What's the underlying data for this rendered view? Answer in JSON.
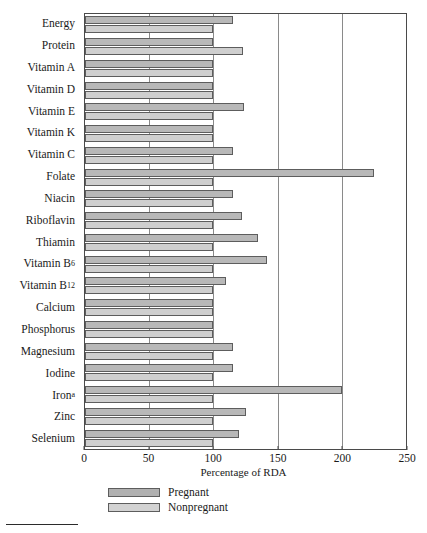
{
  "chart_data": {
    "type": "bar",
    "orientation": "horizontal",
    "title": "",
    "xlabel": "Percentage of RDA",
    "ylabel": "",
    "xlim": [
      0,
      250
    ],
    "xticks": [
      0,
      50,
      100,
      150,
      200,
      250
    ],
    "xtick_labels": [
      "0",
      "50",
      "100",
      "150",
      "200",
      "250"
    ],
    "grid": true,
    "grid_axis": "x",
    "legend_position": "bottom-left",
    "categories": [
      "Energy",
      "Protein",
      "Vitamin A",
      "Vitamin D",
      "Vitamin E",
      "Vitamin K",
      "Vitamin C",
      "Folate",
      "Niacin",
      "Riboflavin",
      "Thiamin",
      "Vitamin B6",
      "Vitamin B12",
      "Calcium",
      "Phosphorus",
      "Magnesium",
      "Iodine",
      "Iron",
      "Zinc",
      "Selenium"
    ],
    "category_labels_html": [
      "Energy",
      "Protein",
      "Vitamin A",
      "Vitamin D",
      "Vitamin E",
      "Vitamin K",
      "Vitamin C",
      "Folate",
      "Niacin",
      "Riboflavin",
      "Thiamin",
      "Vitamin B<sub>6</sub>",
      "Vitamin B<sub>12</sub>",
      "Calcium",
      "Phosphorus",
      "Magnesium",
      "Iodine",
      "Iron<sup>a</sup>",
      "Zinc",
      "Selenium"
    ],
    "series": [
      {
        "name": "Pregnant",
        "color": "#b8b8b8",
        "values": [
          115,
          100,
          100,
          100,
          124,
          100,
          115,
          225,
          115,
          122,
          135,
          142,
          110,
          100,
          100,
          115,
          115,
          200,
          125,
          120
        ]
      },
      {
        "name": "Nonpregnant",
        "color": "#cfcfcf",
        "values": [
          100,
          123,
          100,
          100,
          100,
          100,
          100,
          100,
          100,
          100,
          100,
          100,
          100,
          100,
          100,
          100,
          100,
          100,
          100,
          100
        ]
      }
    ]
  },
  "legend": {
    "items": [
      {
        "label": "Pregnant",
        "key": "pregnant"
      },
      {
        "label": "Nonpregnant",
        "key": "nonpregnant"
      }
    ]
  },
  "axis": {
    "x_title": "Percentage of RDA"
  },
  "colors": {
    "pregnant_bar": "#b8b8b8",
    "nonpregnant_bar": "#cfcfcf",
    "bar_border": "#5d5d5d",
    "axis": "#4a4a4a",
    "gridline": "#8a8a8a",
    "text": "#1a1a1a",
    "background": "#ffffff"
  },
  "footnote": {
    "rule_present": true
  }
}
